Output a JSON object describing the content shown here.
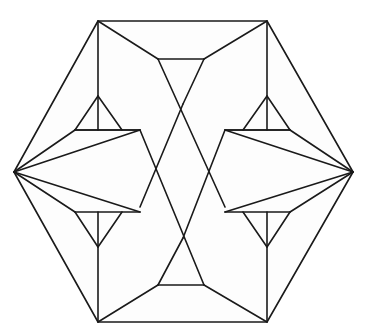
{
  "figure": {
    "type": "line-drawing",
    "background_color": "#ffffff",
    "stroke_color": "#1a1a1a",
    "fill_color": "#fdfdfd",
    "stroke_width": 1.6,
    "canvas": {
      "width": 366,
      "height": 336
    },
    "symmetry": "3-fold rotational (C3) with 180-degree point symmetry",
    "vertices": {
      "outer_hexagon": [
        {
          "name": "top-left",
          "x": 98,
          "y": 21
        },
        {
          "name": "top-right",
          "x": 267,
          "y": 21
        },
        {
          "name": "right",
          "x": 353,
          "y": 172
        },
        {
          "name": "bottom-right",
          "x": 267,
          "y": 322
        },
        {
          "name": "bottom-left",
          "x": 98,
          "y": 322
        },
        {
          "name": "left",
          "x": 14,
          "y": 172
        }
      ],
      "inner_ring": [
        {
          "name": "upper-left-post-top",
          "x": 98,
          "y": 21
        },
        {
          "name": "upper-left-post-bottom",
          "x": 98,
          "y": 130
        },
        {
          "name": "upper-right-post-top",
          "x": 267,
          "y": 21
        },
        {
          "name": "upper-right-post-bottom",
          "x": 267,
          "y": 130
        },
        {
          "name": "lower-left-post-top",
          "x": 98,
          "y": 212
        },
        {
          "name": "lower-left-post-bottom",
          "x": 98,
          "y": 322
        },
        {
          "name": "lower-right-post-top",
          "x": 267,
          "y": 212
        },
        {
          "name": "lower-right-post-bottom",
          "x": 267,
          "y": 322
        }
      ],
      "central_hexagon": [
        {
          "x": 140,
          "y": 130
        },
        {
          "x": 225,
          "y": 130
        },
        {
          "x": 249,
          "y": 172
        },
        {
          "x": 225,
          "y": 207
        },
        {
          "x": 140,
          "y": 207
        },
        {
          "x": 118,
          "y": 172
        }
      ],
      "top_small_edge": {
        "x1": 158,
        "y1": 59,
        "x2": 204,
        "y2": 59
      },
      "bottom_small_edge": {
        "x1": 158,
        "y1": 285,
        "x2": 204,
        "y2": 285
      },
      "left_upper_notch": {
        "x1": 75,
        "y1": 130,
        "x2": 98,
        "y2": 96
      },
      "right_upper_notch": {
        "x1": 290,
        "y1": 130,
        "x2": 267,
        "y2": 96
      }
    },
    "edge_count": 36,
    "face_count": 14
  }
}
